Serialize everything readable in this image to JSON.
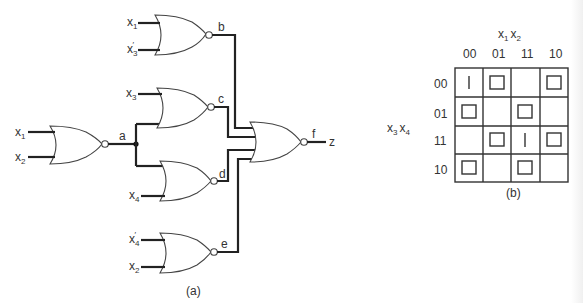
{
  "figure": {
    "circuit": {
      "caption": "(a)",
      "gates": [
        {
          "id": "g_a",
          "type": "NOR",
          "inputs": [
            "x1",
            "x2"
          ],
          "output_label": "a"
        },
        {
          "id": "g_b",
          "type": "NOR",
          "inputs": [
            "x1",
            "x3'"
          ],
          "output_label": "b"
        },
        {
          "id": "g_c",
          "type": "NOR",
          "inputs": [
            "x3",
            "a"
          ],
          "output_label": "c"
        },
        {
          "id": "g_d",
          "type": "NOR",
          "inputs": [
            "a",
            "x4"
          ],
          "output_label": "d"
        },
        {
          "id": "g_e",
          "type": "NOR",
          "inputs": [
            "x4'",
            "x2"
          ],
          "output_label": "e"
        },
        {
          "id": "g_f",
          "type": "NOR",
          "inputs": [
            "b",
            "c",
            "d",
            "e"
          ],
          "output_label": "f"
        }
      ],
      "labels": {
        "a": "a",
        "b": "b",
        "c": "c",
        "d": "d",
        "e": "e",
        "f": "f",
        "z": "z",
        "x": "x",
        "sub1": "1",
        "sub2": "2",
        "sub3": "3",
        "sub4": "4",
        "prime": "′"
      },
      "output": "z"
    },
    "kmap": {
      "caption": "(b)",
      "col_var_label": {
        "v1": "x",
        "s1": "1",
        "v2": "x",
        "s2": "2"
      },
      "row_var_label": {
        "v1": "x",
        "s1": "3",
        "v2": "x",
        "s2": "4"
      },
      "col_headers": [
        "00",
        "01",
        "11",
        "10"
      ],
      "row_headers": [
        "00",
        "01",
        "11",
        "10"
      ],
      "cells": [
        [
          "bar",
          "box",
          "",
          "box"
        ],
        [
          "box",
          "",
          "box",
          ""
        ],
        [
          "",
          "box",
          "bar",
          "box"
        ],
        [
          "box",
          "",
          "box",
          ""
        ]
      ],
      "legend": {
        "bar": "vertical line mark",
        "box": "square mark"
      }
    }
  }
}
